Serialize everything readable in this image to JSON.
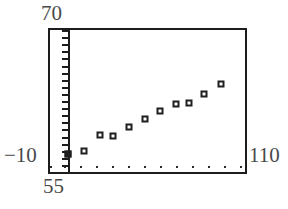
{
  "chart_data": {
    "type": "scatter",
    "title": "",
    "xlabel": "",
    "ylabel": "",
    "xlim": [
      55,
      110
    ],
    "ylim": [
      -10,
      70
    ],
    "grid": false,
    "legend": null,
    "axis_labels": {
      "y_max": "70",
      "y_min": "−10",
      "x_min": "55",
      "x_max": "110"
    },
    "x_tick_values": [
      55,
      59,
      63.5,
      68,
      72.5,
      77,
      81.5,
      86,
      90.5,
      95,
      99.5,
      104,
      108.5
    ],
    "y_tick_values": [
      -10,
      -6,
      -2,
      2,
      6,
      10,
      14,
      18,
      22,
      26,
      30,
      34,
      38,
      42,
      46,
      50,
      54,
      58,
      62,
      66,
      70
    ],
    "y_axis_x_value": 60,
    "points": [
      {
        "x": 60.0,
        "y": 0.0,
        "marker": "filled-square"
      },
      {
        "x": 64.7,
        "y": 1.7,
        "marker": "open-square"
      },
      {
        "x": 69.0,
        "y": 11.0,
        "marker": "open-square"
      },
      {
        "x": 72.8,
        "y": 10.4,
        "marker": "open-square"
      },
      {
        "x": 77.3,
        "y": 15.5,
        "marker": "open-square"
      },
      {
        "x": 81.7,
        "y": 20.0,
        "marker": "open-square"
      },
      {
        "x": 86.1,
        "y": 24.5,
        "marker": "open-square"
      },
      {
        "x": 90.4,
        "y": 28.4,
        "marker": "open-square"
      },
      {
        "x": 94.3,
        "y": 29.0,
        "marker": "open-square"
      },
      {
        "x": 98.5,
        "y": 34.0,
        "marker": "open-square"
      },
      {
        "x": 103.2,
        "y": 39.7,
        "marker": "open-square"
      }
    ],
    "colors": {
      "frame": "#1c1c1c",
      "marker": "#1f1f1f",
      "label": "#494949",
      "background": "#ffffff"
    }
  }
}
